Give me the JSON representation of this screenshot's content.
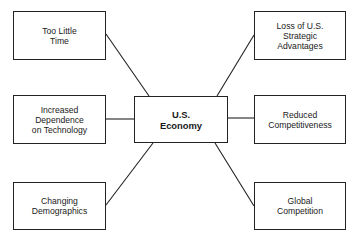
{
  "diagram": {
    "center": {
      "id": "us-economy",
      "label": "U.S.\nEconomy"
    },
    "causes": [
      {
        "id": "too-little-time",
        "label": "Too Little\nTime"
      },
      {
        "id": "increased-dependence",
        "label": "Increased Dependence\non Technology"
      },
      {
        "id": "changing-demographics",
        "label": "Changing\nDemographics"
      }
    ],
    "effects": [
      {
        "id": "loss-strategic-advantages",
        "label": "Loss of U.S.\nStrategic\nAdvantages"
      },
      {
        "id": "reduced-competitiveness",
        "label": "Reduced\nCompetitiveness"
      },
      {
        "id": "global-competition",
        "label": "Global\nCompetition"
      }
    ],
    "edges": [
      {
        "from": "too-little-time",
        "to": "us-economy"
      },
      {
        "from": "increased-dependence",
        "to": "us-economy"
      },
      {
        "from": "changing-demographics",
        "to": "us-economy"
      },
      {
        "from": "us-economy",
        "to": "loss-strategic-advantages"
      },
      {
        "from": "us-economy",
        "to": "reduced-competitiveness"
      },
      {
        "from": "us-economy",
        "to": "global-competition"
      }
    ],
    "colors": {
      "line": "#222222",
      "box_border": "#222222",
      "background": "#ffffff"
    }
  }
}
